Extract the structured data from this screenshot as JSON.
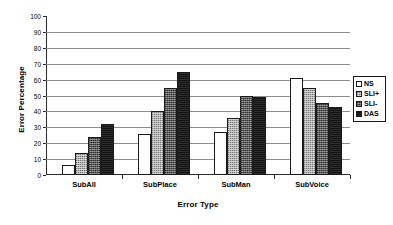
{
  "chart_data": {
    "type": "bar",
    "title": "",
    "xlabel": "Error Type",
    "ylabel": "Error Percentage",
    "categories": [
      "SubAll",
      "SubPlace",
      "SubMan",
      "SubVoice"
    ],
    "series": [
      {
        "name": "NS",
        "values": [
          6,
          26,
          27,
          61
        ],
        "color": "#ffffff"
      },
      {
        "name": "SLI+",
        "values": [
          14,
          40,
          36,
          54.5
        ],
        "color": "#9e9e9e"
      },
      {
        "name": "SLI-",
        "values": [
          24,
          55,
          49.5,
          45
        ],
        "color": "#595959"
      },
      {
        "name": "DAS",
        "values": [
          32,
          65,
          49,
          43
        ],
        "color": "#141414"
      }
    ],
    "ylim": [
      0,
      100
    ],
    "ytick_step": 10,
    "yticks": [
      0,
      10,
      20,
      30,
      40,
      50,
      60,
      70,
      80,
      90,
      100
    ],
    "ytick_labels": [
      "0",
      "10",
      "20",
      "30",
      "40",
      "50",
      "60",
      "70",
      "80",
      "90",
      "100"
    ],
    "grid": true,
    "grid_axis": "y",
    "legend_position": "right",
    "legend_entries": [
      "NS",
      "SLI+",
      "SLI-",
      "DAS"
    ]
  }
}
